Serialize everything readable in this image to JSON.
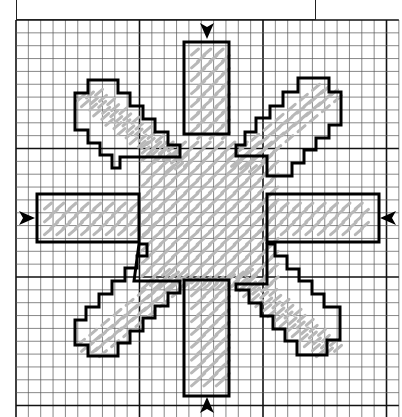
{
  "caption": {
    "text": "14-count fabric - 1¾ x 1¾ inches"
  },
  "grid": {
    "origin_x": 16,
    "origin_y": 20,
    "cell_w": 12.35,
    "cell_h": 12.85,
    "cols": 31,
    "rows": 31,
    "major_every": 10,
    "minor_color": "#555555",
    "major_color": "#111111"
  },
  "colors": {
    "outline": "#000000",
    "stitch": "#b8b8b8",
    "background": "#ffffff"
  },
  "outlines": [
    {
      "name": "top-arm",
      "points": "184,42 229,42 229,134 184,134"
    },
    {
      "name": "bottom-arm",
      "points": "184,280 229,280 229,396 184,396"
    },
    {
      "name": "left-arm",
      "points": "37,194 139,194 139,242 37,242"
    },
    {
      "name": "right-arm",
      "points": "267,194 379,194 379,242 267,242"
    },
    {
      "name": "upper-left-arm",
      "points": "88,80 118,80 118,93 130,93 130,106 143,106 143,119 155,119 155,132 168,132 168,145 180,145 180,157 120,157 120,168 112,168 112,155 100,155 100,143 88,143 88,130 75,130 75,93 88,93"
    },
    {
      "name": "upper-right-arm",
      "points": "298,78 329,78 329,92 341,92 341,125 329,125 329,138 316,138 316,150 304,150 304,163 292,163 292,176 267,176 267,156 236,156 236,145 245,145 245,132 256,132 256,118 270,118 270,106 283,106 283,92 298,92"
    },
    {
      "name": "lower-left-arm",
      "points": "139,244 147,244 147,256 137,256 137,268 125,268 125,281 112,281 112,294 99,294 99,307 86,307 86,320 75,320 75,345 88,345 88,356 118,356 118,343 130,343 130,331 143,331 143,318 155,318 155,306 168,306 168,293 180,293 180,281 134,281"
    },
    {
      "name": "lower-right-arm",
      "points": "267,244 275,244 275,256 287,256 287,269 299,269 299,281 312,281 312,294 324,294 324,307 340,307 340,340 327,340 327,355 297,355 297,341 285,341 285,329 273,329 273,316 261,316 261,303 249,303 249,290 236,290 236,284 267,284"
    }
  ],
  "arrows": [
    {
      "name": "top-center-arrow",
      "x": 207,
      "y": 30,
      "dir": "down"
    },
    {
      "name": "bottom-center-arrow",
      "x": 207,
      "y": 406,
      "dir": "up"
    },
    {
      "name": "left-center-arrow",
      "x": 26,
      "y": 218,
      "dir": "right"
    },
    {
      "name": "right-center-arrow",
      "x": 389,
      "y": 218,
      "dir": "left"
    }
  ],
  "stitch_regions": [
    {
      "name": "top-arm-stitches",
      "x0": 195,
      "y0": 52,
      "x1": 222,
      "y1": 140
    },
    {
      "name": "bottom-arm-stitches",
      "x0": 195,
      "y0": 280,
      "x1": 222,
      "y1": 385
    },
    {
      "name": "left-arm-stitches",
      "x0": 48,
      "y0": 206,
      "x1": 150,
      "y1": 232
    },
    {
      "name": "right-arm-stitches",
      "x0": 260,
      "y0": 206,
      "x1": 370,
      "y1": 232
    },
    {
      "name": "center-stitches",
      "x0": 145,
      "y0": 145,
      "x1": 270,
      "y1": 290
    }
  ],
  "diagonal_stitches": [
    {
      "name": "upper-left-stitches",
      "x0": 90,
      "y0": 95,
      "x1": 175,
      "y1": 160,
      "dir": "down-right"
    },
    {
      "name": "upper-right-stitches",
      "x0": 240,
      "y0": 90,
      "x1": 325,
      "y1": 160,
      "dir": "down-left"
    },
    {
      "name": "lower-left-stitches",
      "x0": 90,
      "y0": 275,
      "x1": 175,
      "y1": 345,
      "dir": "down-left"
    },
    {
      "name": "lower-right-stitches",
      "x0": 240,
      "y0": 275,
      "x1": 325,
      "y1": 345,
      "dir": "down-right"
    }
  ]
}
